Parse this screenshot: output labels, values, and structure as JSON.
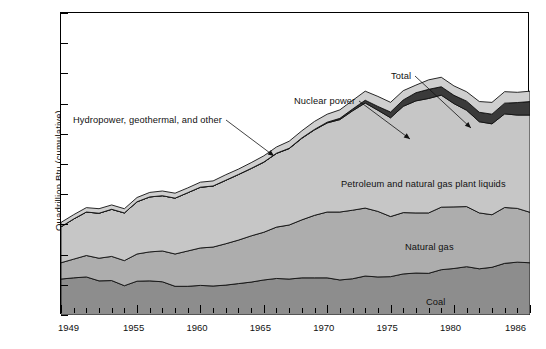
{
  "chart_data": {
    "type": "area",
    "stacked": true,
    "title": "",
    "xlabel": "",
    "ylabel": "Quadrillion Btu (cumulative)",
    "ylim": [
      0,
      100
    ],
    "ytick_step": 10,
    "yticks": [
      "0",
      "10",
      "20",
      "30",
      "40",
      "50",
      "60",
      "70",
      "80",
      "90",
      "100"
    ],
    "xlim": [
      1949,
      1986
    ],
    "xticks_labeled": [
      "1949",
      "1955",
      "1960",
      "1965",
      "1970",
      "1975",
      "1980",
      "1986"
    ],
    "xtick_minor_step": 1,
    "grid": false,
    "legend_position": "inline-annotations",
    "x": [
      1949,
      1950,
      1951,
      1952,
      1953,
      1954,
      1955,
      1956,
      1957,
      1958,
      1959,
      1960,
      1961,
      1962,
      1963,
      1964,
      1965,
      1966,
      1967,
      1968,
      1969,
      1970,
      1971,
      1972,
      1973,
      1974,
      1975,
      1976,
      1977,
      1978,
      1979,
      1980,
      1981,
      1982,
      1983,
      1984,
      1985,
      1986
    ],
    "series": [
      {
        "name": "Coal",
        "color": "#8d8d8d",
        "values": [
          11.9,
          12.3,
          12.6,
          11.3,
          11.4,
          9.7,
          11.2,
          11.3,
          11.0,
          9.5,
          9.5,
          9.8,
          9.6,
          9.9,
          10.4,
          10.9,
          11.6,
          12.1,
          11.9,
          12.3,
          12.3,
          12.3,
          11.6,
          12.0,
          12.9,
          12.6,
          12.7,
          13.6,
          13.9,
          13.8,
          15.0,
          15.4,
          16.0,
          15.3,
          15.8,
          17.1,
          17.5,
          17.3
        ]
      },
      {
        "name": "Natural gas",
        "color": "#adadad",
        "values": [
          5.4,
          6.2,
          7.1,
          7.5,
          8.0,
          8.3,
          9.0,
          9.6,
          10.2,
          10.7,
          11.7,
          12.4,
          12.9,
          13.7,
          14.4,
          15.3,
          15.8,
          17.0,
          17.9,
          19.2,
          20.7,
          21.8,
          22.5,
          22.7,
          22.5,
          21.7,
          19.9,
          20.3,
          19.9,
          20.0,
          20.7,
          20.4,
          19.9,
          18.5,
          17.4,
          18.5,
          17.8,
          16.7
        ]
      },
      {
        "name": "Petroleum and natural gas plant liquids",
        "color": "#c6c6c6",
        "values": [
          11.9,
          13.3,
          14.4,
          14.9,
          15.6,
          15.8,
          17.3,
          18.2,
          18.3,
          18.5,
          19.3,
          20.1,
          20.2,
          21.0,
          21.7,
          22.3,
          23.2,
          24.4,
          25.3,
          27.0,
          28.3,
          29.5,
          30.6,
          32.9,
          34.8,
          33.5,
          32.7,
          35.2,
          37.1,
          37.9,
          37.1,
          34.2,
          31.9,
          30.2,
          30.1,
          31.0,
          30.9,
          32.2
        ]
      },
      {
        "name": "Nuclear power",
        "color": "#3a3a3a",
        "values": [
          0,
          0,
          0,
          0,
          0,
          0,
          0,
          0,
          0,
          0,
          0,
          0.02,
          0.02,
          0.03,
          0.04,
          0.04,
          0.04,
          0.06,
          0.09,
          0.14,
          0.15,
          0.24,
          0.41,
          0.58,
          0.91,
          1.27,
          1.9,
          2.11,
          2.7,
          3.02,
          2.78,
          2.74,
          3.01,
          3.13,
          3.2,
          3.55,
          4.15,
          4.47
        ]
      },
      {
        "name": "Hydropower, geothermal, and other",
        "color": "#cfcfcf",
        "values": [
          1.45,
          1.42,
          1.45,
          1.5,
          1.44,
          1.39,
          1.41,
          1.49,
          1.56,
          1.64,
          1.59,
          1.66,
          1.68,
          1.82,
          1.77,
          1.9,
          2.06,
          2.07,
          2.35,
          2.35,
          2.65,
          2.65,
          2.82,
          2.86,
          3.01,
          3.31,
          3.22,
          3.07,
          2.52,
          3.14,
          3.14,
          3.12,
          3.11,
          3.55,
          3.9,
          3.8,
          3.39,
          3.44
        ]
      }
    ],
    "annotations": [
      {
        "text": "Hydropower, geothermal, and other",
        "x_px": 72,
        "y_px": 114,
        "arrow_to_x": 273,
        "arrow_to_y": 155
      },
      {
        "text": "Nuclear power",
        "x_px": 293,
        "y_px": 95,
        "arrow_to_x": 409,
        "arrow_to_y": 138
      },
      {
        "text": "Total",
        "x_px": 390,
        "y_px": 70,
        "arrow_to_x": 470,
        "arrow_to_y": 127
      },
      {
        "text": "Petroleum and natural gas plant liquids",
        "x_px": 340,
        "y_px": 178,
        "inside": true
      },
      {
        "text": "Natural gas",
        "x_px": 404,
        "y_px": 241,
        "inside": true
      },
      {
        "text": "Coal",
        "x_px": 425,
        "y_px": 296,
        "inside": true
      }
    ]
  }
}
